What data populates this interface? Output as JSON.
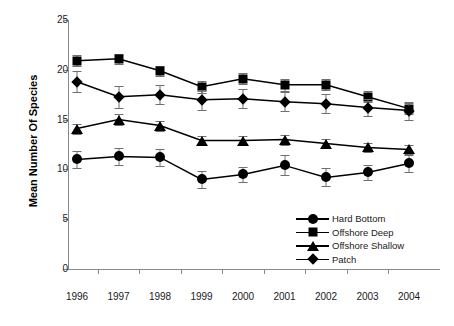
{
  "chart_data": {
    "type": "line",
    "title": "",
    "xlabel": "",
    "ylabel": "Mean Number Of Species",
    "categories": [
      "1996",
      "1997",
      "1998",
      "1999",
      "2000",
      "2001",
      "2002",
      "2003",
      "2004"
    ],
    "ylim": [
      0,
      25
    ],
    "yticks": [
      0,
      5,
      10,
      15,
      20,
      25
    ],
    "grid": false,
    "legend_position": "inside-bottom-right",
    "series": [
      {
        "name": "Hard Bottom",
        "marker": "circle",
        "color": "#000000",
        "values": [
          11.0,
          11.3,
          11.2,
          9.0,
          9.5,
          10.4,
          9.2,
          9.7,
          10.6
        ],
        "errors": [
          0.85,
          0.85,
          0.85,
          0.85,
          0.75,
          1.0,
          0.9,
          0.75,
          0.85
        ]
      },
      {
        "name": "Offshore Deep",
        "marker": "square",
        "color": "#000000",
        "values": [
          20.9,
          21.1,
          19.9,
          18.3,
          19.1,
          18.5,
          18.5,
          17.3,
          16.1
        ],
        "errors": [
          0.55,
          0.5,
          0.5,
          0.6,
          0.55,
          0.6,
          0.55,
          0.55,
          0.55
        ]
      },
      {
        "name": "Offshore Shallow",
        "marker": "triangle",
        "color": "#000000",
        "values": [
          14.1,
          15.0,
          14.4,
          12.9,
          12.9,
          13.0,
          12.6,
          12.2,
          12.0
        ],
        "errors": [
          0.5,
          0.55,
          0.5,
          0.5,
          0.5,
          0.5,
          0.5,
          0.45,
          0.5
        ]
      },
      {
        "name": "Patch",
        "marker": "diamond",
        "color": "#000000",
        "values": [
          18.8,
          17.3,
          17.5,
          17.0,
          17.1,
          16.8,
          16.6,
          16.2,
          15.9
        ],
        "errors": [
          1.05,
          1.1,
          0.95,
          1.0,
          0.95,
          0.95,
          0.95,
          0.85,
          0.9
        ]
      }
    ]
  },
  "legend": {
    "items": [
      {
        "label": "Hard Bottom",
        "marker": "circle"
      },
      {
        "label": "Offshore Deep",
        "marker": "square"
      },
      {
        "label": "Offshore Shallow",
        "marker": "triangle"
      },
      {
        "label": "Patch",
        "marker": "diamond"
      }
    ]
  },
  "axes": {
    "y_title": "Mean Number Of Species"
  }
}
